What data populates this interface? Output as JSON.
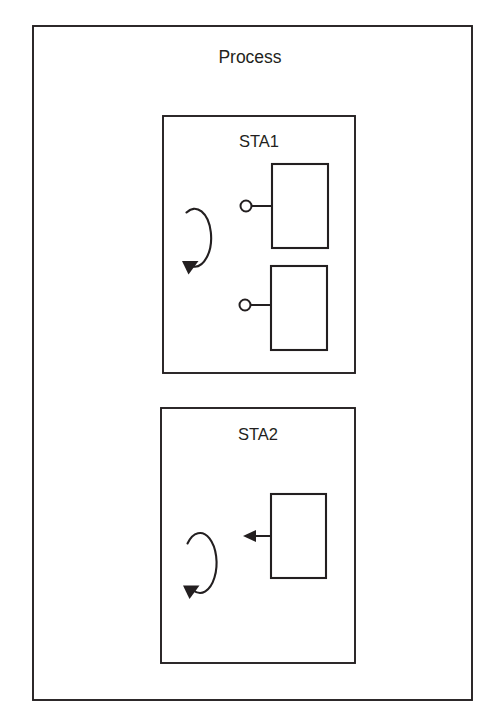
{
  "diagram": {
    "type": "block-diagram",
    "title": "Process",
    "canvas": {
      "width": 484,
      "height": 712
    },
    "colors": {
      "stroke": "#231f20",
      "fill": "#ffffff",
      "background": "#ffffff"
    },
    "outer_frame": {
      "label": "Process",
      "x": 33,
      "y": 26,
      "width": 439,
      "height": 674,
      "label_x": 250,
      "label_y": 63
    },
    "stations": [
      {
        "id": "sta1",
        "label": "STA1",
        "x": 163,
        "y": 116,
        "width": 192,
        "height": 257,
        "label_x": 259,
        "label_y": 147,
        "loop": {
          "name": "rotation-loop",
          "cx": 200,
          "cy": 231,
          "rx": 16,
          "ry": 29,
          "direction": "clockwise",
          "arrow_x": 189,
          "arrow_y": 268
        },
        "blocks": [
          {
            "id": "sta1-block-1",
            "x": 272,
            "y": 164,
            "width": 56,
            "height": 84,
            "connector": {
              "type": "circle-port",
              "circle_cx": 246,
              "circle_cy": 206,
              "circle_r": 5.5,
              "line_x1": 252,
              "line_x2": 272,
              "line_y": 206
            }
          },
          {
            "id": "sta1-block-2",
            "x": 271,
            "y": 266,
            "width": 56,
            "height": 84,
            "connector": {
              "type": "circle-port",
              "circle_cx": 245,
              "circle_cy": 305,
              "circle_r": 5.5,
              "line_x1": 251,
              "line_x2": 271,
              "line_y": 305
            }
          }
        ]
      },
      {
        "id": "sta2",
        "label": "STA2",
        "x": 161,
        "y": 408,
        "width": 194,
        "height": 255,
        "label_x": 258,
        "label_y": 440,
        "loop": {
          "name": "rotation-loop",
          "cx": 201,
          "cy": 563,
          "rx": 16,
          "ry": 30,
          "direction": "clockwise",
          "arrow_x": 190,
          "arrow_y": 592
        },
        "blocks": [
          {
            "id": "sta2-block-1",
            "x": 271,
            "y": 494,
            "width": 55,
            "height": 84,
            "connector": {
              "type": "arrow-left",
              "line_x1": 271,
              "line_x2": 252,
              "line_y": 536,
              "arrow_tip_x": 243,
              "arrow_tip_y": 536
            }
          }
        ]
      }
    ]
  }
}
